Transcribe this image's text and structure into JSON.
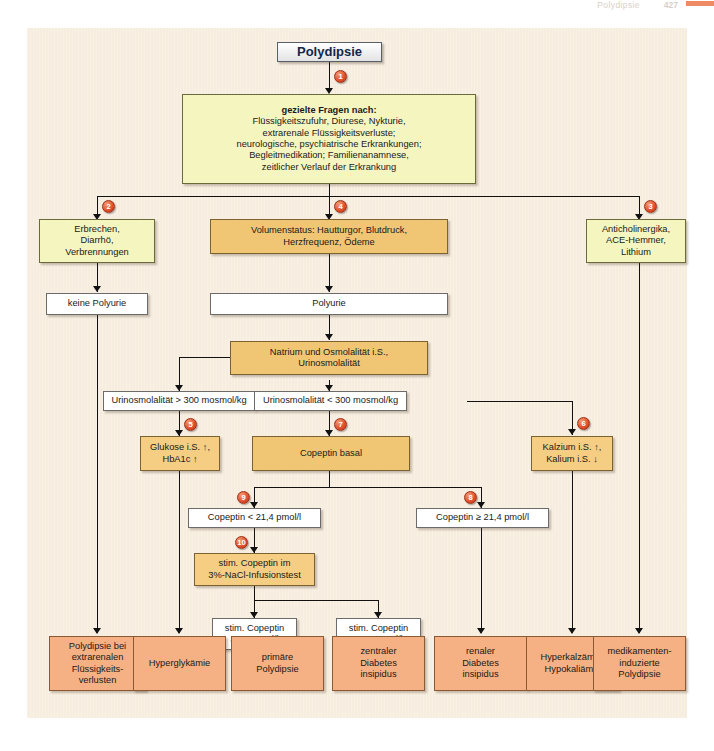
{
  "running_head": {
    "title": "Polydipsie",
    "page": "427"
  },
  "diagram": {
    "title_node": "Polydipsie",
    "nodes": {
      "questions_heading": "gezielte Fragen nach:",
      "questions_l1": "Flüssigkeitszufuhr, Diurese, Nykturie,",
      "questions_l2": "extrarenale Flüssigkeitsverluste;",
      "questions_l3": "neurologische, psychiatrische Erkrankungen;",
      "questions_l4": "Begleitmedikation; Familienanamnese,",
      "questions_l5": "zeitlicher Verlauf der Erkrankung",
      "vomiting_l1": "Erbrechen,",
      "vomiting_l2": "Diarrhö,",
      "vomiting_l3": "Verbrennungen",
      "volume_l1": "Volumenstatus: Hautturgor, Blutdruck,",
      "volume_l2": "Herzfrequenz, Ödeme",
      "drugs_l1": "Anticholinergika,",
      "drugs_l2": "ACE-Hemmer,",
      "drugs_l3": "Lithium",
      "no_polyuria": "keine Polyurie",
      "polyuria": "Polyurie",
      "sodium_l1": "Natrium und Osmolalität i.S.,",
      "sodium_l2": "Urinosmolalität",
      "uosm_high": "Urinosmolalität > 300 mosmol/kg",
      "uosm_low": "Urinosmolalität < 300 mosmol/kg",
      "glucose_l1": "Glukose i.S. ↑,",
      "glucose_l2": "HbA1c ↑",
      "copeptin_basal": "Copeptin basal",
      "calcium_l1": "Kalzium i.S. ↑,",
      "calcium_l2": "Kalium i.S. ↓",
      "copeptin_lt": "Copeptin < 21,4 pmol/l",
      "copeptin_ge": "Copeptin ≥ 21,4 pmol/l",
      "stim_test_l1": "stim. Copeptin im",
      "stim_test_l2": "3%-NaCl-Infusionstest",
      "stim_ge_l1": "stim. Copeptin",
      "stim_ge_l2": "≥ 4,9 pmol/l",
      "stim_lt_l1": "stim. Copeptin",
      "stim_lt_l2": "< 4,9 pmol/l"
    },
    "outcomes": [
      {
        "id": "extrarenal",
        "lines": [
          "Polydipsie bei",
          "extrarenalen",
          "Flüssigkeits-",
          "verlusten"
        ]
      },
      {
        "id": "hyperglycemia",
        "lines": [
          "Hyperglykämie"
        ]
      },
      {
        "id": "primary-polydipsia",
        "lines": [
          "primäre",
          "Polydipsie"
        ]
      },
      {
        "id": "central-di",
        "lines": [
          "zentraler",
          "Diabetes",
          "insipidus"
        ]
      },
      {
        "id": "renal-di",
        "lines": [
          "renaler",
          "Diabetes",
          "insipidus"
        ]
      },
      {
        "id": "hypercalcemia",
        "lines": [
          "Hyperkalzämie,",
          "Hypokaliämie"
        ]
      },
      {
        "id": "drug-induced",
        "lines": [
          "medikamenten-",
          "induzierte",
          "Polydipsie"
        ]
      }
    ],
    "badges": [
      "1",
      "2",
      "3",
      "4",
      "5",
      "6",
      "7",
      "8",
      "9",
      "10"
    ],
    "colors": {
      "canvas": "#f7eddf",
      "yellow": "#f5f5c0",
      "gold": "#f0c674",
      "orange": "#f5b183",
      "white": "#ffffff",
      "badge": "#e1502a",
      "line": "#111111",
      "tab": "#f08a64"
    }
  }
}
